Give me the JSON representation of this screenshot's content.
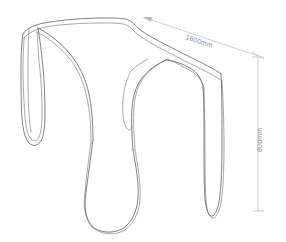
{
  "drawing": {
    "title": "Three-legged ribbon stool technical sketch",
    "background_color": "#ffffff",
    "object_line_color": "#4a4a4a",
    "dimension_line_color": "#b9b9b9",
    "dimension_text_color": "#8c8c8c"
  },
  "dimensions": {
    "width": {
      "label": "1600mm",
      "icon": "dimension-arrow-icon",
      "orientation": "diagonal"
    },
    "height": {
      "label": "800mm",
      "icon": "dimension-tick-icon",
      "orientation": "vertical"
    }
  },
  "parts": {
    "top_surface": "seat-top-surface",
    "left_leg": "left-leg",
    "center_leg": "center-leg",
    "right_leg": "right-leg"
  }
}
